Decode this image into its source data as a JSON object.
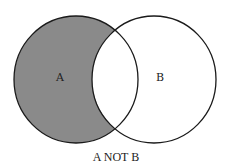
{
  "diagram": {
    "type": "venn",
    "caption": "A NOT B",
    "sets": [
      {
        "label": "A",
        "shaded": true
      },
      {
        "label": "B",
        "shaded": false
      }
    ],
    "colors": {
      "shade": "#8a8a8a",
      "stroke": "#1a1a1a",
      "background": "#ffffff"
    }
  }
}
